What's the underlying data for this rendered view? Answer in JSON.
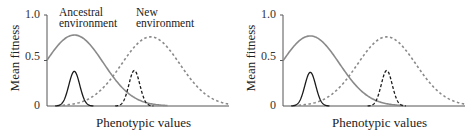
{
  "chart_data": [
    {
      "type": "line",
      "title": "",
      "xlabel": "Phenotypic values",
      "ylabel": "Mean fitness",
      "ylim": [
        0,
        1.0
      ],
      "yticks": [
        "0",
        "0.5",
        "1.0"
      ],
      "grid": false,
      "legend": null,
      "annotations": [
        "Ancestral environment",
        "New environment"
      ],
      "series": [
        {
          "name": "Fitness function, ancestral environment",
          "style": "solid gray",
          "peak_x": 0.15,
          "peak_y": 0.78,
          "sd": 0.16
        },
        {
          "name": "Fitness function, new environment",
          "style": "dashed gray",
          "peak_x": 0.57,
          "peak_y": 0.76,
          "sd": 0.16
        },
        {
          "name": "Phenotype distribution, ancestral population",
          "style": "solid black",
          "peak_x": 0.15,
          "peak_y": 0.38,
          "sd": 0.03
        },
        {
          "name": "Phenotype distribution, population in new environment",
          "style": "dashed black",
          "peak_x": 0.48,
          "peak_y": 0.39,
          "sd": 0.03
        }
      ]
    },
    {
      "type": "line",
      "title": "",
      "xlabel": "Phenotypic values",
      "ylabel": "Mean fitness",
      "ylim": [
        0,
        1.0
      ],
      "yticks": [
        "0",
        "0.5",
        "1.0"
      ],
      "grid": false,
      "legend": null,
      "annotations": [],
      "series": [
        {
          "name": "Fitness function, ancestral environment",
          "style": "solid gray",
          "peak_x": 0.15,
          "peak_y": 0.77,
          "sd": 0.16
        },
        {
          "name": "Fitness function, new environment",
          "style": "dashed gray",
          "peak_x": 0.57,
          "peak_y": 0.76,
          "sd": 0.16
        },
        {
          "name": "Phenotype distribution, ancestral population",
          "style": "solid black",
          "peak_x": 0.15,
          "peak_y": 0.37,
          "sd": 0.03
        },
        {
          "name": "Phenotype distribution, population in new environment",
          "style": "dashed black",
          "peak_x": 0.57,
          "peak_y": 0.39,
          "sd": 0.03
        }
      ]
    }
  ],
  "labels": {
    "ylabel": "Mean fitness",
    "xlabel": "Phenotypic values",
    "tick_1": "1.0",
    "tick_05": "0.5",
    "tick_0": "0",
    "ancestral_line1": "Ancestral",
    "ancestral_line2": "environment",
    "new_line1": "New",
    "new_line2": "environment"
  },
  "colors": {
    "fitness_curve": "#8a8a8a",
    "distribution_curve": "#1a1a1a",
    "axis": "#555555"
  }
}
